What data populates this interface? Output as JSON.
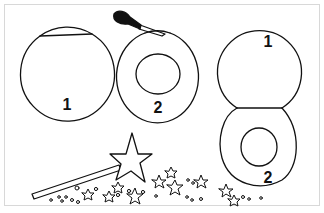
{
  "illustration": {
    "description": "Craft diagram: paper circles numbered 1 and 2, paintbrush, star wand with sparkles",
    "colors": {
      "line": "#111111",
      "background": "#ffffff",
      "border": "#d8d8d8"
    },
    "labels": {
      "circle_a": "1",
      "circle_b": "2",
      "circle_c_top": "1",
      "circle_c_bottom": "2"
    },
    "icons": [
      "paintbrush-icon",
      "star-wand-icon",
      "sparkle-stars-icon"
    ]
  }
}
